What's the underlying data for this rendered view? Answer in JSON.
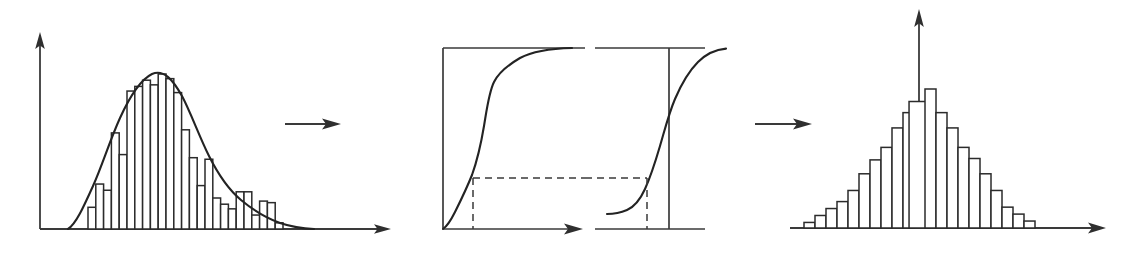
{
  "figure": {
    "background_color": "#ffffff",
    "ink_color": "#2b2b2b",
    "width": 1143,
    "height": 257,
    "panel_count": 3
  },
  "panels": {
    "left": {
      "name": "skewed-histogram-panel",
      "description": "Right-skewed empirical histogram with a smooth fitted density curve overlaid",
      "has_y_axis": true,
      "has_x_axis": true,
      "y_axis_arrow": "up",
      "x_axis_arrow": "right"
    },
    "middle": {
      "name": "cdf-transform-panel",
      "description": "Two framed boxes, each containing an S-shaped cumulative distribution curve, joined by a horizontal dashed level line with vertical dashed droplines",
      "box_count": 2,
      "left_box_has_x_axis_arrow": true,
      "right_box_has_center_vertical_axis": true,
      "dashed_level_line": true
    },
    "right": {
      "name": "normal-histogram-panel",
      "description": "Symmetric bell-shaped histogram with a central vertical axis",
      "has_y_axis": true,
      "has_x_axis": true,
      "y_axis_arrow": "up",
      "x_axis_arrow": "right"
    }
  },
  "arrows": [
    {
      "name": "arrow-left-to-middle",
      "direction": "right",
      "x1": 285,
      "x2": 340,
      "y": 124
    },
    {
      "name": "arrow-middle-to-right",
      "direction": "right",
      "x1": 755,
      "x2": 812,
      "y": 124
    }
  ],
  "chart_data": [
    {
      "type": "bar",
      "name": "skewed-histogram",
      "title": "",
      "xlabel": "",
      "ylabel": "",
      "grid": false,
      "legend": false,
      "bar_count": 25,
      "categories": [
        "1",
        "2",
        "3",
        "4",
        "5",
        "6",
        "7",
        "8",
        "9",
        "10",
        "11",
        "12",
        "13",
        "14",
        "15",
        "16",
        "17",
        "18",
        "19",
        "20",
        "21",
        "22",
        "23",
        "24",
        "25"
      ],
      "values": [
        14,
        29,
        25,
        62,
        48,
        89,
        92,
        96,
        93,
        100,
        97,
        88,
        64,
        46,
        28,
        45,
        20,
        16,
        13,
        24,
        24,
        9,
        18,
        17,
        4
      ],
      "ylim": [
        0,
        105
      ],
      "overlay_curve": {
        "name": "fitted-density-curve",
        "type": "line",
        "description": "smooth right-skewed density envelope over the bars",
        "x": [
          0,
          6,
          14,
          22,
          30,
          38,
          46,
          54,
          62,
          70,
          78,
          86,
          94,
          100
        ],
        "y": [
          0,
          8,
          26,
          52,
          78,
          96,
          100,
          92,
          72,
          50,
          32,
          18,
          7,
          2
        ]
      }
    },
    {
      "type": "line",
      "name": "cdf-curve-left-box",
      "title": "",
      "xlabel": "",
      "ylabel": "",
      "grid": false,
      "legend": false,
      "description": "empirical cumulative distribution function of the skewed variable, rising steeply at the low end then flattening at the top of the frame",
      "x": [
        2,
        5,
        9,
        13,
        17,
        21,
        26,
        32,
        40,
        50,
        62,
        75,
        88,
        100
      ],
      "y": [
        0,
        8,
        18,
        28,
        40,
        55,
        70,
        80,
        86,
        90,
        94,
        97,
        99,
        100
      ],
      "xlim": [
        0,
        100
      ],
      "ylim": [
        0,
        100
      ],
      "marked_level_y": 25,
      "marked_x": 13
    },
    {
      "type": "line",
      "name": "normal-cdf-curve-right-box",
      "title": "",
      "xlabel": "",
      "ylabel": "",
      "grid": false,
      "legend": false,
      "description": "standard normal cumulative distribution function, symmetric S-curve crossing the central vertical axis at the 50 percent level",
      "x": [
        0,
        10,
        20,
        28,
        36,
        44,
        50,
        56,
        64,
        72,
        82,
        92,
        100
      ],
      "y": [
        2,
        3,
        6,
        12,
        23,
        38,
        50,
        62,
        77,
        88,
        95,
        98,
        99
      ],
      "xlim": [
        0,
        100
      ],
      "ylim": [
        0,
        100
      ],
      "marked_level_y": 25,
      "marked_x": 36,
      "center_axis_x": 50
    },
    {
      "type": "bar",
      "name": "normal-histogram",
      "title": "",
      "xlabel": "",
      "ylabel": "",
      "grid": false,
      "legend": false,
      "bar_count": 21,
      "categories": [
        "1",
        "2",
        "3",
        "4",
        "5",
        "6",
        "7",
        "8",
        "9",
        "10",
        "11",
        "12",
        "13",
        "14",
        "15",
        "16",
        "17",
        "18",
        "19",
        "20",
        "21"
      ],
      "values": [
        4,
        9,
        14,
        19,
        27,
        39,
        49,
        58,
        72,
        83,
        91,
        100,
        83,
        72,
        58,
        50,
        39,
        27,
        15,
        10,
        5
      ],
      "ylim": [
        0,
        105
      ],
      "center_axis_category": "12"
    }
  ]
}
